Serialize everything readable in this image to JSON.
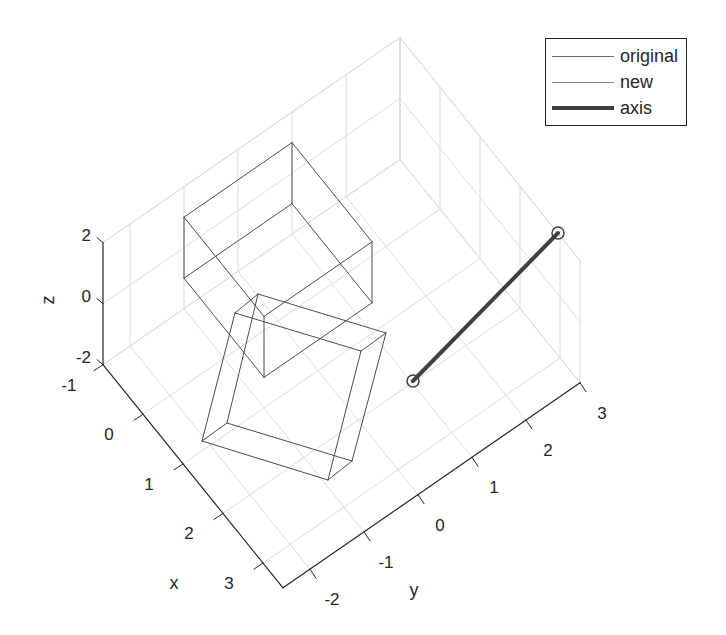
{
  "chart_data": {
    "type": "line3d",
    "title": "",
    "xlabel": "x",
    "ylabel": "y",
    "zlabel": "z",
    "xlim": [
      -1,
      3.5
    ],
    "ylim": [
      -2.5,
      3
    ],
    "zlim": [
      -2,
      2
    ],
    "xticks": [
      -1,
      0,
      1,
      2,
      3
    ],
    "yticks": [
      -2,
      -1,
      0,
      1,
      2,
      3
    ],
    "zticks": [
      -2,
      0,
      2
    ],
    "grid": true,
    "legend_position": "northeast",
    "series": [
      {
        "name": "original",
        "kind": "wireframe-cube",
        "color": "#4d4d4d",
        "linewidth": 1,
        "bounds": {
          "x": [
            -1,
            1
          ],
          "y": [
            -1,
            1
          ],
          "z": [
            -1,
            1
          ]
        }
      },
      {
        "name": "new",
        "kind": "wireframe-cube",
        "color": "#4d4d4d",
        "linewidth": 1,
        "screen_vertices": [
          [
            258,
            294
          ],
          [
            235,
            313
          ],
          [
            386,
            333
          ],
          [
            361,
            351
          ],
          [
            227,
            423
          ],
          [
            202,
            441
          ],
          [
            352,
            461
          ],
          [
            328,
            480
          ]
        ],
        "screen_edges": [
          [
            0,
            1
          ],
          [
            0,
            2
          ],
          [
            1,
            3
          ],
          [
            2,
            3
          ],
          [
            0,
            4
          ],
          [
            1,
            5
          ],
          [
            4,
            5
          ],
          [
            2,
            6
          ],
          [
            3,
            7
          ],
          [
            6,
            7
          ],
          [
            4,
            6
          ],
          [
            5,
            7
          ]
        ]
      },
      {
        "name": "axis",
        "kind": "line-with-end-markers",
        "color": "#404040",
        "linewidth": 4,
        "marker": "circle",
        "screen_points": [
          [
            413,
            381
          ],
          [
            558,
            233
          ]
        ]
      }
    ]
  },
  "axes": {
    "xlabel": "x",
    "ylabel": "y",
    "zlabel": "z",
    "x_tick_labels": [
      "-1",
      "0",
      "1",
      "2",
      "3"
    ],
    "y_tick_labels": [
      "-2",
      "-1",
      "0",
      "1",
      "2",
      "3"
    ],
    "z_tick_labels": [
      "-2",
      "0",
      "2"
    ]
  },
  "legend": {
    "items": [
      {
        "label": "original",
        "style": "thin"
      },
      {
        "label": "new",
        "style": "thin"
      },
      {
        "label": "axis",
        "style": "thick"
      }
    ]
  },
  "colors": {
    "grid": "#dcdcdc",
    "axis_line": "#262626",
    "cube": "#4d4d4d",
    "axis_series": "#404040"
  }
}
